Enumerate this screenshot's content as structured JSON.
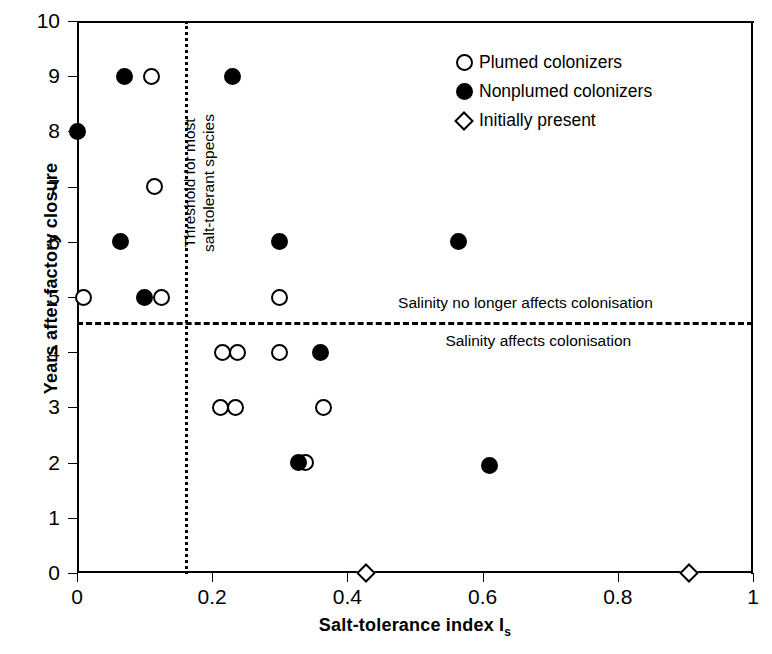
{
  "chart_data": {
    "type": "scatter",
    "title": "",
    "xlabel": "Salt-tolerance index I",
    "xlabel_sub": "s",
    "ylabel": "Years after factory closure",
    "xlim": [
      0,
      1
    ],
    "ylim": [
      0,
      10
    ],
    "xticks": [
      "0",
      "0.2",
      "0.4",
      "0.6",
      "0.8",
      "1"
    ],
    "xtick_values": [
      0,
      0.2,
      0.4,
      0.6,
      0.8,
      1
    ],
    "yticks": [
      "0",
      "1",
      "2",
      "3",
      "4",
      "5",
      "6",
      "7",
      "8",
      "9",
      "10"
    ],
    "ytick_values": [
      0,
      1,
      2,
      3,
      4,
      5,
      6,
      7,
      8,
      9,
      10
    ],
    "grid": false,
    "legend_position": "top-right",
    "series": [
      {
        "name": "Plumed colonizers",
        "marker": "open-circle",
        "color": "#000000",
        "points": [
          {
            "x": 0.11,
            "y": 9
          },
          {
            "x": 0.115,
            "y": 7
          },
          {
            "x": 0.01,
            "y": 5
          },
          {
            "x": 0.125,
            "y": 5
          },
          {
            "x": 0.3,
            "y": 5
          },
          {
            "x": 0.215,
            "y": 4
          },
          {
            "x": 0.238,
            "y": 4
          },
          {
            "x": 0.3,
            "y": 4
          },
          {
            "x": 0.212,
            "y": 3
          },
          {
            "x": 0.235,
            "y": 3
          },
          {
            "x": 0.365,
            "y": 3
          },
          {
            "x": 0.338,
            "y": 2
          }
        ]
      },
      {
        "name": "Nonplumed colonizers",
        "marker": "filled-circle",
        "color": "#000000",
        "points": [
          {
            "x": 0.07,
            "y": 9
          },
          {
            "x": 0.23,
            "y": 9
          },
          {
            "x": 0.0,
            "y": 8
          },
          {
            "x": 0.065,
            "y": 6
          },
          {
            "x": 0.3,
            "y": 6
          },
          {
            "x": 0.565,
            "y": 6
          },
          {
            "x": 0.1,
            "y": 5
          },
          {
            "x": 0.36,
            "y": 4
          },
          {
            "x": 0.328,
            "y": 2
          },
          {
            "x": 0.61,
            "y": 1.95
          }
        ]
      },
      {
        "name": "Initially present",
        "marker": "open-diamond",
        "color": "#000000",
        "points": [
          {
            "x": 0.428,
            "y": 0
          },
          {
            "x": 0.905,
            "y": 0
          }
        ]
      }
    ],
    "reference_lines": [
      {
        "name": "threshold-line",
        "orientation": "vertical",
        "value": 0.16,
        "style": "dotted",
        "label": "Threshold for most\nsalt-tolerant species"
      },
      {
        "name": "salinity-line",
        "orientation": "horizontal",
        "value": 4.55,
        "style": "dashed",
        "label_above": "Salinity no longer affects colonisation",
        "label_below": "Salinity affects colonisation"
      }
    ],
    "annotations": [
      {
        "name": "threshold-annotation-line1",
        "text": "Threshold for most"
      },
      {
        "name": "threshold-annotation-line2",
        "text": "salt-tolerant species"
      },
      {
        "name": "salinity-above-annotation",
        "text": "Salinity no longer affects colonisation"
      },
      {
        "name": "salinity-below-annotation",
        "text": "Salinity affects colonisation"
      }
    ]
  },
  "legend": {
    "items": [
      {
        "label": "Plumed colonizers",
        "marker": "open-circle"
      },
      {
        "label": "Nonplumed colonizers",
        "marker": "filled-circle"
      },
      {
        "label": "Initially present",
        "marker": "open-diamond"
      }
    ]
  }
}
